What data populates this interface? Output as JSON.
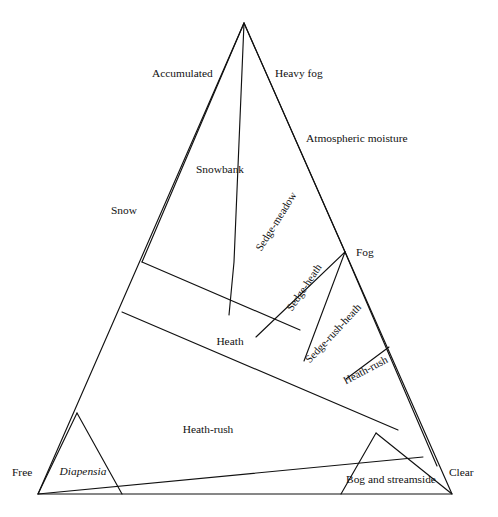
{
  "figure": {
    "kind": "triangular-classification-diagram",
    "shape": "triangle",
    "stroke_color": "#111111",
    "background_color": "#ffffff",
    "apex": {
      "x": 244,
      "y": 23
    },
    "bottom_left": {
      "x": 38,
      "y": 494
    },
    "bottom_right": {
      "x": 452,
      "y": 494
    }
  },
  "axis_labels": {
    "left_upper": "Accumulated",
    "left_lower": "Snow",
    "right_upper": "Heavy fog",
    "right_mid": "Atmospheric moisture",
    "right_lower": "Fog",
    "bottom_left_corner": "Free",
    "bottom_right_corner": "Clear"
  },
  "zones": [
    {
      "id": "snowbank",
      "label": "Snowbank",
      "x": 220,
      "y": 170,
      "rotation": 0,
      "style": "normal"
    },
    {
      "id": "sedge-meadow",
      "label": "Sedge-meadow",
      "x": 277,
      "y": 222,
      "rotation": -58,
      "style": "normal"
    },
    {
      "id": "sedge-heath",
      "label": "Sedge-heath",
      "x": 305,
      "y": 288,
      "rotation": -56,
      "style": "normal"
    },
    {
      "id": "sedge-rush-heath",
      "label": "Sedge-rush-heath",
      "x": 334,
      "y": 334,
      "rotation": -47,
      "style": "normal"
    },
    {
      "id": "heath",
      "label": "Heath",
      "x": 230,
      "y": 342,
      "rotation": 0,
      "style": "normal"
    },
    {
      "id": "heath-rush-band",
      "label": "Heath-rush",
      "x": 366,
      "y": 371,
      "rotation": -28,
      "style": "normal"
    },
    {
      "id": "heath-rush-main",
      "label": "Heath-rush",
      "x": 208,
      "y": 430,
      "rotation": 0,
      "style": "normal"
    },
    {
      "id": "diapensia",
      "label": "Diapensia",
      "x": 83,
      "y": 472,
      "rotation": 0,
      "style": "italic"
    },
    {
      "id": "bog-and-streamside",
      "label": "Bog and streamside",
      "x": 391,
      "y": 480,
      "rotation": 0,
      "style": "normal"
    }
  ],
  "geometry": {
    "outline": "M 244 23 L 38 494 L 452 494 Z",
    "dividers": [
      {
        "name": "apex-to-snow-left",
        "d": "M 244 23 L 142 262"
      },
      {
        "name": "apex-snowbank-right",
        "d": "M 244 23 L 234 262 L 229 315"
      },
      {
        "name": "apex-to-fog-right",
        "d": "M 244 23 L 345 252"
      },
      {
        "name": "snow-band-upper",
        "d": "M 142 262 L 300 330"
      },
      {
        "name": "heath-band-upper",
        "d": "M 122 312 L 398 430"
      },
      {
        "name": "heath-band-lower",
        "d": "M 38 494 L 423 457"
      },
      {
        "name": "sedge-meadow-heath-split",
        "d": "M 345 252 L 256 337"
      },
      {
        "name": "sedge-heath-split",
        "d": "M 345 252 L 304 361"
      },
      {
        "name": "sedge-rush-heath-split",
        "d": "M 389 347 L 346 379"
      },
      {
        "name": "fog-right-descend",
        "d": "M 345 252 L 437 466"
      },
      {
        "name": "diapensia-left",
        "d": "M 77 413 L 38 494"
      },
      {
        "name": "diapensia-right",
        "d": "M 77 413 L 122 494"
      },
      {
        "name": "bog-left",
        "d": "M 376 433 L 341 494"
      },
      {
        "name": "bog-right",
        "d": "M 376 433 L 452 494"
      }
    ]
  }
}
